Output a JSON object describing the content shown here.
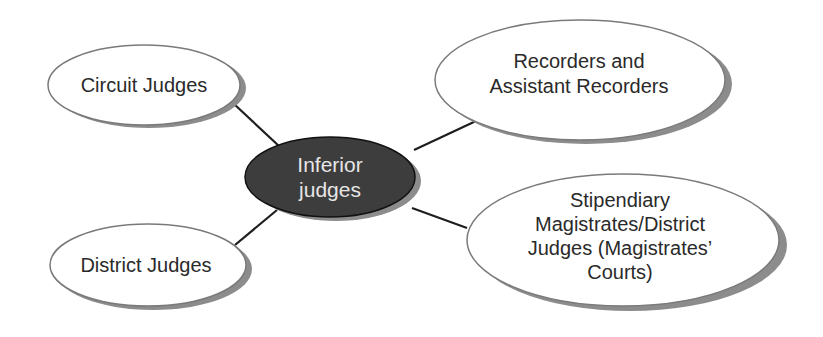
{
  "diagram": {
    "type": "mind-map",
    "center": {
      "id": "inferior-judges",
      "lines": [
        "Inferior",
        "judges"
      ],
      "fill": "#3d3d3d",
      "text_color": "#e6e6e6"
    },
    "nodes": [
      {
        "id": "circuit-judges",
        "lines": [
          "Circuit Judges"
        ]
      },
      {
        "id": "recorders",
        "lines": [
          "Recorders and",
          "Assistant Recorders"
        ]
      },
      {
        "id": "district-judges",
        "lines": [
          "District Judges"
        ]
      },
      {
        "id": "stipendiary-magistrates",
        "lines": [
          "Stipendiary",
          "Magistrates/District",
          "Judges (Magistrates’",
          "Courts)"
        ]
      }
    ],
    "edges": [
      {
        "from": "inferior-judges",
        "to": "circuit-judges"
      },
      {
        "from": "inferior-judges",
        "to": "recorders"
      },
      {
        "from": "inferior-judges",
        "to": "district-judges"
      },
      {
        "from": "inferior-judges",
        "to": "stipendiary-magistrates"
      }
    ],
    "colors": {
      "node_fill": "#ffffff",
      "node_stroke": "#7a7a7a",
      "shadow": "#8c8c8c",
      "connector": "#1e1e1e"
    }
  }
}
